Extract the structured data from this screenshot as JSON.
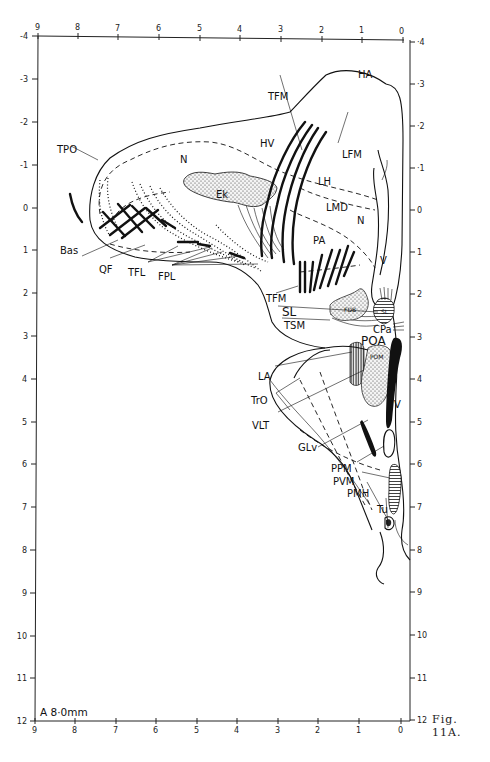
{
  "figure": {
    "caption": "Fig. 11A.",
    "plate_label": "A 8·0mm"
  },
  "axes": {
    "top_x_ticks": [
      "9",
      "8",
      "7",
      "6",
      "5",
      "4",
      "3",
      "2",
      "1",
      "0"
    ],
    "bottom_x_ticks": [
      "9",
      "8",
      "7",
      "6",
      "5",
      "4",
      "3",
      "2",
      "1",
      "0"
    ],
    "left_y_ticks": [
      "-4",
      "-3",
      "-2",
      "-1",
      "0",
      "1",
      "2",
      "3",
      "4",
      "5",
      "6",
      "7",
      "8",
      "9",
      "10",
      "11",
      "12"
    ],
    "right_y_ticks": [
      "4",
      "3",
      "2",
      "1",
      "0",
      "1",
      "2",
      "3",
      "4",
      "5",
      "6",
      "7",
      "8",
      "9",
      "10",
      "11",
      "12"
    ],
    "right_y_ticks_display": [
      "·4",
      "·3",
      "·2",
      "·1",
      "0",
      "1",
      "2",
      "3",
      "4",
      "5",
      "6",
      "7",
      "8",
      "9",
      "10",
      "11",
      "12"
    ],
    "x_range": [
      9,
      0
    ],
    "y_range": [
      -4,
      12
    ]
  },
  "regions": {
    "HA": "HA",
    "HV": "HV",
    "TFM_top": "TFM",
    "TPO": "TPO",
    "N_left": "N",
    "LFM": "LFM",
    "LH": "LH",
    "LMD": "LMD",
    "N_right": "N",
    "Ek": "Ek",
    "PA": "PA",
    "V_upper": "V",
    "Bas": "Bas",
    "QF": "QF",
    "TFL": "TFL",
    "FPL": "FPL",
    "TFM_bottom": "TFM",
    "FDB": "FDB",
    "SL_label": "SL",
    "SL_inner": "SL",
    "TSM": "TSM",
    "CPa": "CPa",
    "POA": "POA",
    "POM": "POM",
    "LA": "LA",
    "TrO": "TrO",
    "V_lower": "V",
    "VLT": "VLT",
    "GLv": "GLv",
    "PPM": "PPM",
    "PVM": "PVM",
    "PMH": "PMH",
    "Tu": "Tu"
  }
}
